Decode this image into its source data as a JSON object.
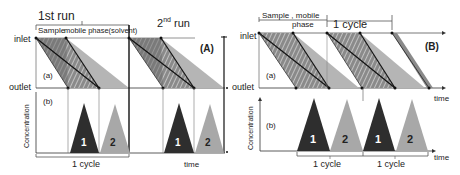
{
  "panelA": {
    "tag": "(A)",
    "run1_label": "1st run",
    "run2_label": "2",
    "run2_sup": "nd",
    "run2_suffix": " run",
    "sample_label": "Sample",
    "mobile_label": "mobile phase(solvent)",
    "inlet": "inlet",
    "outlet": "outlet",
    "sub_a": "(a)",
    "sub_b": "(b)",
    "ylabel": "Concentration",
    "cycle": "1 cycle",
    "time": "time",
    "peak1": "1",
    "peak2": "2"
  },
  "panelB": {
    "tag": "(B)",
    "sample_label": "Sample , mobile",
    "phase_label": "phase",
    "cycle_top": "1 cycle",
    "inlet": "inlet",
    "outlet": "outlet",
    "sub_a": "(a)",
    "sub_b": "(b)",
    "ylabel": "Concentration",
    "time_top": "time",
    "time_bottom": "time",
    "cycle1": "1 cycle",
    "cycle2": "1 cycle",
    "peak1a": "1",
    "peak2a": "2",
    "peak1b": "1",
    "peak2b": "2"
  },
  "colors": {
    "dark": "#2e2e2e",
    "light": "#a8a8a8",
    "band": "#7d7d7d",
    "axis": "#333333"
  }
}
